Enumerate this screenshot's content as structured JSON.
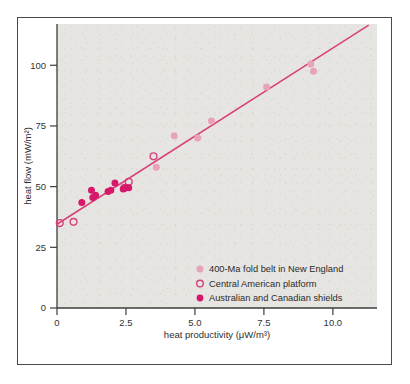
{
  "chart_data": {
    "type": "scatter",
    "title": "",
    "xlabel": "heat productivity  (μW/m³)",
    "ylabel": "heat flow  (mW/m²)",
    "xlim": [
      0,
      11.6
    ],
    "ylim": [
      0,
      117
    ],
    "xticks": [
      "0",
      "2.5",
      "5.0",
      "7.5",
      "10.0"
    ],
    "xtick_values": [
      0,
      2.5,
      5.0,
      7.5,
      10.0
    ],
    "yticks": [
      "0",
      "25",
      "50",
      "75",
      "100"
    ],
    "ytick_values": [
      0,
      25,
      50,
      75,
      100
    ],
    "grid": false,
    "legend_position": "inside-lower-right",
    "series": [
      {
        "name": "400-Ma fold belt in New England",
        "marker": "filled-circle",
        "color": "#e8a3bb",
        "points": [
          {
            "x": 3.6,
            "y": 58.0
          },
          {
            "x": 4.25,
            "y": 71.0
          },
          {
            "x": 5.1,
            "y": 70.0
          },
          {
            "x": 5.6,
            "y": 77.0
          },
          {
            "x": 7.6,
            "y": 91.0
          },
          {
            "x": 9.2,
            "y": 100.5
          },
          {
            "x": 9.3,
            "y": 97.5
          }
        ]
      },
      {
        "name": "Central American platform",
        "marker": "open-circle",
        "color": "#d8407a",
        "points": [
          {
            "x": 0.1,
            "y": 35.0
          },
          {
            "x": 0.6,
            "y": 35.5
          },
          {
            "x": 2.45,
            "y": 49.5
          },
          {
            "x": 2.6,
            "y": 52.0
          },
          {
            "x": 3.5,
            "y": 62.5
          }
        ]
      },
      {
        "name": "Australian and Canadian shields",
        "marker": "filled-circle",
        "color": "#d6186a",
        "points": [
          {
            "x": 0.9,
            "y": 43.5
          },
          {
            "x": 1.25,
            "y": 48.5
          },
          {
            "x": 1.3,
            "y": 45.5
          },
          {
            "x": 1.4,
            "y": 46.5
          },
          {
            "x": 1.85,
            "y": 48.0
          },
          {
            "x": 1.95,
            "y": 48.5
          },
          {
            "x": 2.1,
            "y": 51.5
          },
          {
            "x": 2.4,
            "y": 49.0
          },
          {
            "x": 2.5,
            "y": 49.5
          },
          {
            "x": 2.6,
            "y": 49.5
          }
        ]
      }
    ],
    "trend_line": {
      "color": "#d8407a",
      "x_start": 0.0,
      "y_start": 34.5,
      "x_end": 11.3,
      "y_end": 116.5
    }
  },
  "legend": {
    "items": [
      {
        "label": "400-Ma fold belt in New England",
        "marker": "filled-circle",
        "color": "#e8a3bb"
      },
      {
        "label": "Central American platform",
        "marker": "open-circle",
        "color": "#d8407a"
      },
      {
        "label": "Australian and Canadian shields",
        "marker": "filled-circle",
        "color": "#d6186a"
      }
    ]
  },
  "colors": {
    "plot_background": "#e6e5e1",
    "page_background": "#ffffff",
    "frame_border": "#4a4a4a",
    "axis": "#3c3c3c",
    "accent_light": "#e8a3bb",
    "accent_dark": "#d6186a",
    "accent_line": "#d8407a"
  }
}
